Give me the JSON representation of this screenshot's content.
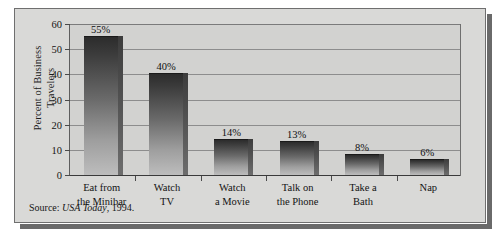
{
  "chart_data": {
    "type": "bar",
    "title": "",
    "xlabel": "",
    "ylabel_lines": [
      "Percent of Business",
      "Travelers"
    ],
    "ylabel": "Percent of Business Travelers",
    "ylim": [
      0,
      60
    ],
    "yticks": [
      0,
      10,
      20,
      30,
      40,
      50,
      60
    ],
    "ytick_labels": [
      "0",
      "10",
      "20",
      "30",
      "40",
      "50",
      "60"
    ],
    "grid": true,
    "legend": null,
    "categories": [
      "Eat from the Minibar",
      "Watch TV",
      "Watch a Movie",
      "Talk on the Phone",
      "Take a Bath",
      "Nap"
    ],
    "category_label_lines": [
      [
        "Eat from",
        "the Minibar"
      ],
      [
        "Watch",
        "TV"
      ],
      [
        "Watch",
        "a Movie"
      ],
      [
        "Talk on",
        "the Phone"
      ],
      [
        "Take a",
        "Bath"
      ],
      [
        "Nap",
        ""
      ]
    ],
    "values": [
      55,
      40,
      14,
      13,
      8,
      6
    ],
    "value_labels": [
      "55%",
      "40%",
      "14%",
      "13%",
      "8%",
      "6%"
    ],
    "bar_color_top": "#2c2c2c",
    "bar_color_bottom": "#bdbdbd"
  },
  "source": {
    "prefix": "Source: ",
    "publication": "USA Today",
    "suffix": ", 1994."
  },
  "colors": {
    "card_background": "#d9d9d7",
    "plot_background": "#d2d2d0",
    "border": "#6f6f6f",
    "gridline": "#8d8d8d",
    "shadow": "#6a6a6a",
    "text": "#141414"
  }
}
